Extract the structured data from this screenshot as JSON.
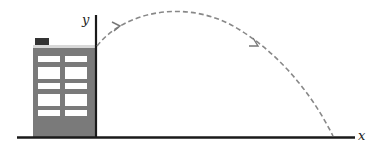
{
  "diagram": {
    "type": "projectile-motion",
    "axes": {
      "x_label": "x",
      "y_label": "y"
    },
    "building": {
      "window_rows": 5,
      "window_columns": 2
    },
    "trajectory": {
      "style": "dashed",
      "arrows": 2
    },
    "colors": {
      "building": "#7a7a7a",
      "window": "#ffffff",
      "chimney": "#333333",
      "axis": "#1a1a1a",
      "trajectory": "#888888"
    }
  }
}
